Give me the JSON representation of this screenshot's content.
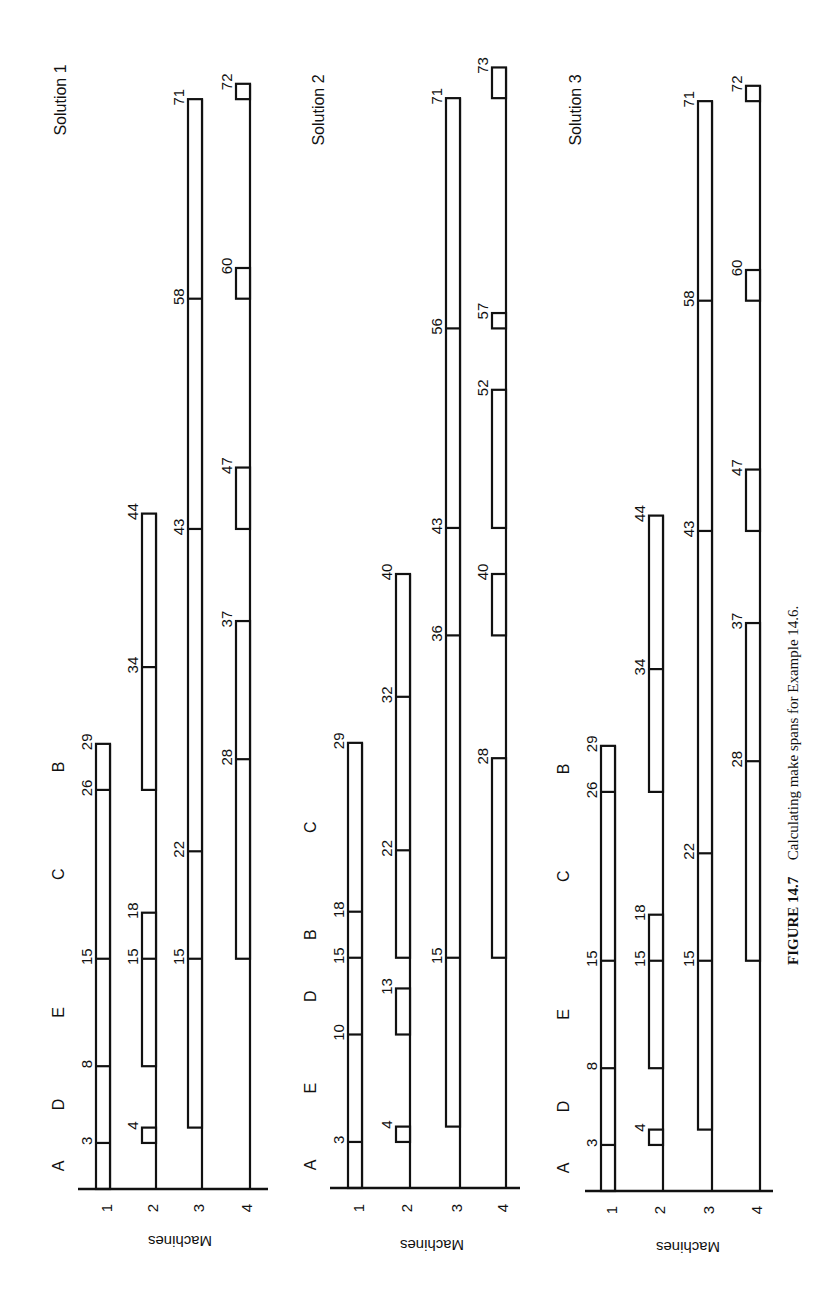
{
  "caption": {
    "label": "FIGURE 14.7",
    "text": "Calculating make spans for Example 14.6."
  },
  "chart_data": [
    {
      "type": "gantt",
      "title": "Solution 1",
      "ylabel": "Machines",
      "machines": [
        "1",
        "2",
        "3",
        "4"
      ],
      "job_sequence": [
        "A",
        "D",
        "E",
        "C",
        "B"
      ],
      "job_label_times": [
        1.5,
        5.5,
        11.5,
        20.5,
        27.5
      ],
      "makespan": 72,
      "rows": [
        {
          "machine": "1",
          "segments": [
            [
              0,
              3
            ],
            [
              3,
              8
            ],
            [
              8,
              15
            ],
            [
              15,
              26
            ],
            [
              26,
              29
            ]
          ],
          "labels": [
            3,
            8,
            15,
            26,
            29
          ]
        },
        {
          "machine": "2",
          "segments": [
            [
              3,
              4
            ],
            [
              8,
              15
            ],
            [
              15,
              18
            ],
            [
              26,
              34
            ],
            [
              34,
              44
            ]
          ],
          "labels": [
            4,
            15,
            18,
            34,
            44
          ]
        },
        {
          "machine": "3",
          "segments": [
            [
              4,
              15
            ],
            [
              15,
              22
            ],
            [
              22,
              43
            ],
            [
              43,
              58
            ],
            [
              58,
              71
            ]
          ],
          "labels": [
            15,
            22,
            43,
            58,
            71
          ]
        },
        {
          "machine": "4",
          "segments": [
            [
              15,
              28
            ],
            [
              28,
              37
            ],
            [
              43,
              47
            ],
            [
              58,
              60
            ],
            [
              71,
              72
            ]
          ],
          "labels": [
            28,
            37,
            47,
            60,
            72
          ]
        }
      ],
      "extra_labels": [
        {
          "row": 0,
          "t": 3,
          "text": "3"
        }
      ]
    },
    {
      "type": "gantt",
      "title": "Solution 2",
      "ylabel": "Machines",
      "machines": [
        "1",
        "2",
        "3",
        "4"
      ],
      "job_sequence": [
        "A",
        "E",
        "D",
        "B",
        "C"
      ],
      "job_label_times": [
        1.5,
        6.5,
        12.5,
        16.5,
        23.5
      ],
      "makespan": 73,
      "rows": [
        {
          "machine": "1",
          "segments": [
            [
              0,
              3
            ],
            [
              3,
              10
            ],
            [
              10,
              15
            ],
            [
              15,
              18
            ],
            [
              18,
              29
            ]
          ],
          "labels": [
            3,
            10,
            15,
            18,
            29
          ]
        },
        {
          "machine": "2",
          "segments": [
            [
              3,
              4
            ],
            [
              10,
              13
            ],
            [
              15,
              22
            ],
            [
              22,
              32
            ],
            [
              32,
              40
            ]
          ],
          "labels": [
            4,
            13,
            22,
            32,
            40
          ]
        },
        {
          "machine": "3",
          "segments": [
            [
              4,
              15
            ],
            [
              15,
              36
            ],
            [
              36,
              43
            ],
            [
              43,
              56
            ],
            [
              56,
              71
            ]
          ],
          "labels": [
            15,
            36,
            43,
            56,
            71
          ]
        },
        {
          "machine": "4",
          "segments": [
            [
              15,
              28
            ],
            [
              36,
              40
            ],
            [
              43,
              52
            ],
            [
              56,
              57
            ],
            [
              71,
              73
            ]
          ],
          "labels": [
            28,
            40,
            52,
            57,
            73
          ]
        }
      ]
    },
    {
      "type": "gantt",
      "title": "Solution 3",
      "ylabel": "Machines",
      "machines": [
        "1",
        "2",
        "3",
        "4"
      ],
      "job_sequence": [
        "A",
        "D",
        "E",
        "C",
        "B"
      ],
      "job_label_times": [
        1.5,
        5.5,
        11.5,
        20.5,
        27.5
      ],
      "makespan": 72,
      "rows": [
        {
          "machine": "1",
          "segments": [
            [
              0,
              3
            ],
            [
              3,
              8
            ],
            [
              8,
              15
            ],
            [
              15,
              26
            ],
            [
              26,
              29
            ]
          ],
          "labels": [
            3,
            8,
            15,
            26,
            29
          ]
        },
        {
          "machine": "2",
          "segments": [
            [
              3,
              4
            ],
            [
              8,
              15
            ],
            [
              15,
              18
            ],
            [
              26,
              34
            ],
            [
              34,
              44
            ]
          ],
          "labels": [
            4,
            15,
            18,
            34,
            44
          ]
        },
        {
          "machine": "3",
          "segments": [
            [
              4,
              15
            ],
            [
              15,
              22
            ],
            [
              22,
              43
            ],
            [
              43,
              58
            ],
            [
              58,
              71
            ]
          ],
          "labels": [
            15,
            22,
            43,
            58,
            71
          ]
        },
        {
          "machine": "4",
          "segments": [
            [
              15,
              28
            ],
            [
              28,
              37
            ],
            [
              43,
              47
            ],
            [
              58,
              60
            ],
            [
              71,
              72
            ]
          ],
          "labels": [
            28,
            37,
            47,
            60,
            72
          ]
        }
      ]
    }
  ],
  "layout": {
    "panels": [
      {
        "baseline_y": 1189,
        "rows_x": [
          110,
          156,
          202,
          250
        ],
        "axis_x": [
          78,
          268
        ],
        "title_xy": [
          60,
          60
        ],
        "ylabel_xy": [
          180,
          1236
        ],
        "tick_label_y": 1208,
        "job_label_x": 58
      },
      {
        "baseline_y": 1188,
        "rows_x": [
          362,
          410,
          460,
          506
        ],
        "axis_x": [
          330,
          520
        ],
        "title_xy": [
          318,
          70
        ],
        "ylabel_xy": [
          432,
          1240
        ],
        "tick_label_y": 1208,
        "job_label_x": 310
      },
      {
        "baseline_y": 1191,
        "rows_x": [
          615,
          663,
          712,
          760
        ],
        "axis_x": [
          585,
          773
        ],
        "title_xy": [
          575,
          70
        ],
        "ylabel_xy": [
          688,
          1242
        ],
        "tick_label_y": 1210,
        "job_label_x": 563
      }
    ],
    "px_per_unit": 15.35,
    "bar_width": 14,
    "caption_xy": [
      798,
      965
    ]
  }
}
